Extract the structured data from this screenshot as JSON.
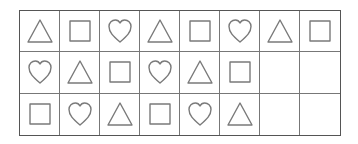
{
  "grid": {
    "rows": 3,
    "columns": 8,
    "stroke_color": "#7a7a7a",
    "border_color": "#555555",
    "cells": [
      [
        "triangle",
        "square",
        "heart",
        "triangle",
        "square",
        "heart",
        "triangle",
        "square"
      ],
      [
        "heart",
        "triangle",
        "square",
        "heart",
        "triangle",
        "square",
        "",
        ""
      ],
      [
        "square",
        "heart",
        "triangle",
        "square",
        "heart",
        "triangle",
        "",
        ""
      ]
    ]
  }
}
